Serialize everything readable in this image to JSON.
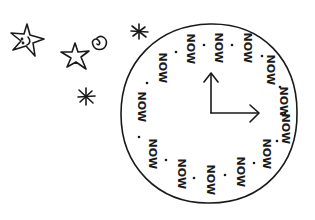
{
  "illustration": {
    "title": "Clock where every hour says NOW",
    "ink_color": "#1a1a1a",
    "background_color": "#ffffff",
    "clock": {
      "center": [
        210,
        113
      ],
      "radius_x": 88,
      "radius_y": 90,
      "hour_hand_tip": [
        211,
        74
      ],
      "minute_hand_tip": [
        258,
        113
      ],
      "words": [
        {
          "text": "NOW",
          "x": 190,
          "y": 47
        },
        {
          "text": "NOW",
          "x": 218,
          "y": 46
        },
        {
          "text": "NOW",
          "x": 247,
          "y": 46
        },
        {
          "text": "NOW",
          "x": 162,
          "y": 66
        },
        {
          "text": "NOW",
          "x": 270,
          "y": 68
        },
        {
          "text": "NOW",
          "x": 141,
          "y": 105
        },
        {
          "text": "NOW",
          "x": 283,
          "y": 100
        },
        {
          "text": "NOW",
          "x": 285,
          "y": 127
        },
        {
          "text": "NOW",
          "x": 152,
          "y": 152
        },
        {
          "text": "NOW",
          "x": 266,
          "y": 152
        },
        {
          "text": "NOW",
          "x": 181,
          "y": 172
        },
        {
          "text": "NOW",
          "x": 210,
          "y": 178
        },
        {
          "text": "NOW",
          "x": 240,
          "y": 170
        }
      ],
      "dots": [
        [
          176,
          52
        ],
        [
          204,
          45
        ],
        [
          232,
          45
        ],
        [
          262,
          56
        ],
        [
          147,
          83
        ],
        [
          280,
          87
        ],
        [
          285,
          113
        ],
        [
          139,
          137
        ],
        [
          277,
          141
        ],
        [
          166,
          160
        ],
        [
          194,
          178
        ],
        [
          225,
          175
        ],
        [
          254,
          163
        ]
      ]
    },
    "decorations": [
      {
        "type": "star-with-face",
        "x": 24,
        "y": 42
      },
      {
        "type": "star",
        "x": 74,
        "y": 52
      },
      {
        "type": "spiral",
        "x": 98,
        "y": 44
      },
      {
        "type": "asterisk",
        "x": 139,
        "y": 31
      },
      {
        "type": "asterisk",
        "x": 86,
        "y": 97
      }
    ]
  }
}
